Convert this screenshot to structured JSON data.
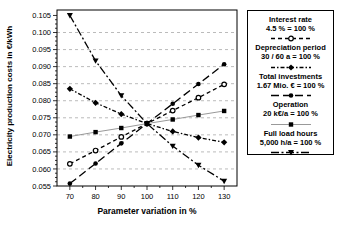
{
  "colors": {
    "background": "#ffffff",
    "line": "#000000",
    "operation_line": "#999999",
    "grid": "#b3b3b3",
    "frame": "#000000",
    "text": "#000000",
    "legend_border": "#000000"
  },
  "chart_data": {
    "type": "line",
    "title": "",
    "xlabel": "Parameter variation in %",
    "ylabel": "Electricity production costs in €/kWh",
    "x": [
      70,
      80,
      90,
      100,
      110,
      120,
      130
    ],
    "xtick_labels": [
      "70",
      "80",
      "90",
      "100",
      "110",
      "120",
      "130"
    ],
    "yticks": [
      0.055,
      0.06,
      0.065,
      0.07,
      0.075,
      0.08,
      0.085,
      0.09,
      0.095,
      0.1,
      0.105
    ],
    "ytick_labels": [
      "0.055",
      "0.060",
      "0.065",
      "0.070",
      "0.075",
      "0.080",
      "0.085",
      "0.090",
      "0.095",
      "0.100",
      "0.105"
    ],
    "xlim": [
      65,
      135
    ],
    "ylim": [
      0.055,
      0.1066
    ],
    "grid": "horizontal-dashed",
    "legend_position": "right",
    "series": [
      {
        "name": "Interest rate",
        "values": [
          0.0615,
          0.0654,
          0.0694,
          0.0733,
          0.0771,
          0.0809,
          0.0848
        ],
        "marker": "open-circle",
        "line_style": "dashed",
        "line_color": "#000000",
        "marker_color": "#000000"
      },
      {
        "name": "Depreciation period",
        "values": [
          0.0835,
          0.0794,
          0.0761,
          0.0733,
          0.071,
          0.0692,
          0.0678
        ],
        "marker": "filled-diamond",
        "line_style": "dash-dot",
        "line_color": "#000000",
        "marker_color": "#000000"
      },
      {
        "name": "Total investments",
        "values": [
          0.0557,
          0.0616,
          0.0675,
          0.0733,
          0.0791,
          0.0849,
          0.0907
        ],
        "marker": "filled-circle",
        "line_style": "long-dash",
        "line_color": "#000000",
        "marker_color": "#000000"
      },
      {
        "name": "Operation",
        "values": [
          0.0695,
          0.0708,
          0.072,
          0.0733,
          0.0745,
          0.0758,
          0.077
        ],
        "marker": "filled-square",
        "line_style": "solid",
        "line_color": "#999999",
        "marker_color": "#000000"
      },
      {
        "name": "Full load hours",
        "values": [
          0.105,
          0.0917,
          0.0815,
          0.0733,
          0.0667,
          0.0611,
          0.0564
        ],
        "marker": "filled-triangle-down",
        "line_style": "long-dash-dot",
        "line_color": "#000000",
        "marker_color": "#000000"
      }
    ],
    "legend": {
      "entries": [
        {
          "title": "Interest rate",
          "value": "4.5 % = 100 %"
        },
        {
          "title": "Depreciation period",
          "value": "30 / 60 a = 100 %"
        },
        {
          "title": "Total investments",
          "value": "1.67 Mio. € = 100 %"
        },
        {
          "title": "Operation",
          "value": "20 k€/a = 100 %"
        },
        {
          "title": "Full load hours",
          "value": "5,000 h/a = 100 %"
        }
      ]
    }
  }
}
